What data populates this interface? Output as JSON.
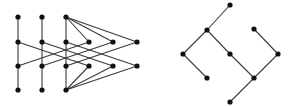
{
  "diagrams": [
    {
      "name": "left-poset",
      "nodes": [
        {
          "id": "a1",
          "x": 18,
          "y": 17
        },
        {
          "id": "a2",
          "x": 18,
          "y": 42
        },
        {
          "id": "a3",
          "x": 18,
          "y": 66
        },
        {
          "id": "a4",
          "x": 18,
          "y": 90
        },
        {
          "id": "b1",
          "x": 42,
          "y": 17
        },
        {
          "id": "b2",
          "x": 42,
          "y": 42
        },
        {
          "id": "b3",
          "x": 42,
          "y": 66
        },
        {
          "id": "b4",
          "x": 42,
          "y": 90
        },
        {
          "id": "c1",
          "x": 66,
          "y": 17
        },
        {
          "id": "c2",
          "x": 66,
          "y": 42
        },
        {
          "id": "c3",
          "x": 66,
          "y": 66
        },
        {
          "id": "c4",
          "x": 66,
          "y": 90
        },
        {
          "id": "d1",
          "x": 89,
          "y": 42
        },
        {
          "id": "d2",
          "x": 89,
          "y": 66
        },
        {
          "id": "e1",
          "x": 113,
          "y": 42
        },
        {
          "id": "e2",
          "x": 113,
          "y": 66
        },
        {
          "id": "f1",
          "x": 137,
          "y": 42
        },
        {
          "id": "f2",
          "x": 137,
          "y": 66
        }
      ],
      "edges": [
        [
          "a1",
          "a2"
        ],
        [
          "a2",
          "a3"
        ],
        [
          "a3",
          "a4"
        ],
        [
          "b1",
          "b2"
        ],
        [
          "b2",
          "b3"
        ],
        [
          "b3",
          "b4"
        ],
        [
          "c1",
          "c2"
        ],
        [
          "c2",
          "c3"
        ],
        [
          "c3",
          "c4"
        ],
        [
          "c1",
          "d1"
        ],
        [
          "c1",
          "e1"
        ],
        [
          "c1",
          "f1"
        ],
        [
          "c4",
          "d2"
        ],
        [
          "c4",
          "e2"
        ],
        [
          "c4",
          "f2"
        ],
        [
          "a2",
          "d2"
        ],
        [
          "a3",
          "d1"
        ],
        [
          "b2",
          "e2"
        ],
        [
          "b3",
          "e1"
        ],
        [
          "c2",
          "f2"
        ],
        [
          "c3",
          "f1"
        ]
      ]
    },
    {
      "name": "right-poset",
      "nodes": [
        {
          "id": "r1",
          "x": 230,
          "y": 5
        },
        {
          "id": "r2",
          "x": 207,
          "y": 30
        },
        {
          "id": "r3",
          "x": 254,
          "y": 29
        },
        {
          "id": "r4",
          "x": 183,
          "y": 54
        },
        {
          "id": "r5",
          "x": 230,
          "y": 54
        },
        {
          "id": "r6",
          "x": 278,
          "y": 54
        },
        {
          "id": "r7",
          "x": 207,
          "y": 78
        },
        {
          "id": "r8",
          "x": 254,
          "y": 78
        },
        {
          "id": "r9",
          "x": 230,
          "y": 102
        }
      ],
      "edges": [
        [
          "r1",
          "r2"
        ],
        [
          "r2",
          "r4"
        ],
        [
          "r2",
          "r5"
        ],
        [
          "r4",
          "r7"
        ],
        [
          "r5",
          "r8"
        ],
        [
          "r3",
          "r6"
        ],
        [
          "r6",
          "r8"
        ],
        [
          "r8",
          "r9"
        ]
      ]
    }
  ],
  "style": {
    "edge_color": "#3a3a3a",
    "node_color": "#111111",
    "node_radius": 2.6
  }
}
